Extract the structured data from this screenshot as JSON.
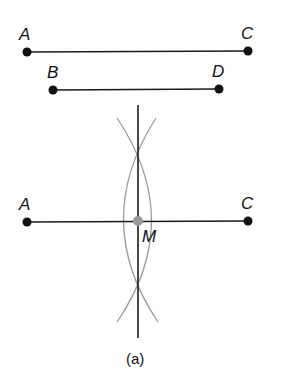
{
  "figure": {
    "caption": "(a)",
    "segments_top": [
      {
        "label_start": "A",
        "label_end": "C"
      },
      {
        "label_start": "B",
        "label_end": "D"
      }
    ],
    "construction": {
      "label_start": "A",
      "label_end": "C",
      "midpoint_label": "M"
    },
    "colors": {
      "line": "#1a1a1a",
      "arc": "#9a9a9a",
      "midpoint": "#9a9a9a"
    }
  }
}
